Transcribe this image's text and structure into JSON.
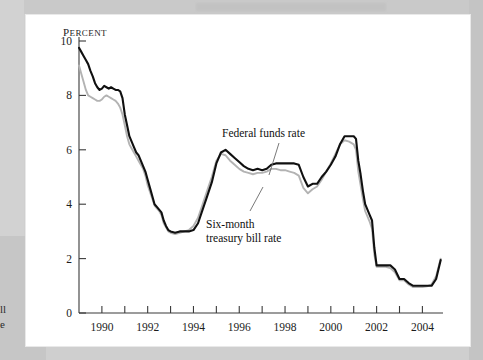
{
  "figure": {
    "y_axis_unit_label": "Percent",
    "y_axis_unit_first_letter": "P",
    "y_axis_unit_rest": "ERCENT"
  },
  "annotations": {
    "federal_funds": "Federal funds rate",
    "six_month_line1": "Six-month",
    "six_month_line2": "treasury bill rate"
  },
  "edge_fragments": {
    "frag1": "ll",
    "frag2": "e"
  },
  "colors": {
    "federal_funds": "#101010",
    "six_month": "#b3b3b3",
    "axis": "#444444",
    "page": "#ffffff",
    "scan_background": "#cfcfcf"
  },
  "chart_data": {
    "type": "line",
    "title": "",
    "xlabel": "",
    "ylabel": "Percent",
    "xlim": [
      1989.0,
      2004.9
    ],
    "ylim": [
      0,
      10
    ],
    "yticks": [
      0,
      2,
      4,
      6,
      8,
      10
    ],
    "ytick_labels": [
      "0",
      "2",
      "4",
      "6",
      "8",
      "10"
    ],
    "xticks": [
      1990,
      1991,
      1992,
      1993,
      1994,
      1995,
      1996,
      1997,
      1998,
      1999,
      2000,
      2001,
      2002,
      2003,
      2004
    ],
    "xtick_labels": [
      "1990",
      "",
      "1992",
      "",
      "1994",
      "",
      "1996",
      "",
      "1998",
      "",
      "2000",
      "",
      "2002",
      "",
      "2004"
    ],
    "labeled_xticks": [
      1990,
      1992,
      1994,
      1996,
      1998,
      2000,
      2002,
      2004
    ],
    "grid": false,
    "legend": "annotated-inline",
    "series": [
      {
        "name": "Federal funds rate",
        "color": "#101010",
        "x": [
          1989.0,
          1989.1,
          1989.2,
          1989.3,
          1989.4,
          1989.5,
          1989.6,
          1989.7,
          1989.8,
          1989.9,
          1990.0,
          1990.1,
          1990.2,
          1990.3,
          1990.4,
          1990.5,
          1990.6,
          1990.7,
          1990.8,
          1990.9,
          1991.0,
          1991.1,
          1991.2,
          1991.3,
          1991.4,
          1991.5,
          1991.6,
          1991.7,
          1991.8,
          1991.9,
          1992.0,
          1992.1,
          1992.2,
          1992.3,
          1992.4,
          1992.5,
          1992.6,
          1992.7,
          1992.8,
          1992.9,
          1993.0,
          1993.2,
          1993.4,
          1993.6,
          1993.8,
          1994.0,
          1994.2,
          1994.4,
          1994.6,
          1994.8,
          1995.0,
          1995.2,
          1995.4,
          1995.6,
          1995.8,
          1996.0,
          1996.2,
          1996.4,
          1996.6,
          1996.8,
          1997.0,
          1997.2,
          1997.4,
          1997.6,
          1997.8,
          1998.0,
          1998.2,
          1998.4,
          1998.6,
          1998.8,
          1999.0,
          1999.2,
          1999.4,
          1999.6,
          1999.8,
          2000.0,
          2000.2,
          2000.4,
          2000.6,
          2000.8,
          2001.0,
          2001.1,
          2001.2,
          2001.3,
          2001.4,
          2001.5,
          2001.6,
          2001.7,
          2001.8,
          2001.9,
          2002.0,
          2002.2,
          2002.4,
          2002.6,
          2002.8,
          2003.0,
          2003.2,
          2003.4,
          2003.6,
          2003.8,
          2004.0,
          2004.2,
          2004.4,
          2004.6,
          2004.8
        ],
        "y": [
          9.75,
          9.6,
          9.45,
          9.3,
          9.15,
          8.9,
          8.7,
          8.45,
          8.3,
          8.2,
          8.25,
          8.35,
          8.3,
          8.25,
          8.3,
          8.25,
          8.2,
          8.2,
          8.15,
          7.9,
          7.3,
          6.9,
          6.5,
          6.3,
          6.1,
          5.9,
          5.8,
          5.6,
          5.4,
          5.2,
          4.9,
          4.6,
          4.3,
          4.0,
          3.9,
          3.8,
          3.7,
          3.4,
          3.2,
          3.05,
          3.0,
          2.95,
          3.0,
          3.0,
          3.0,
          3.05,
          3.3,
          3.8,
          4.3,
          4.8,
          5.5,
          5.9,
          6.0,
          5.85,
          5.7,
          5.55,
          5.4,
          5.3,
          5.25,
          5.3,
          5.25,
          5.3,
          5.45,
          5.5,
          5.5,
          5.5,
          5.5,
          5.5,
          5.45,
          5.0,
          4.65,
          4.75,
          4.75,
          5.0,
          5.2,
          5.45,
          5.75,
          6.2,
          6.5,
          6.5,
          6.5,
          6.4,
          5.6,
          5.1,
          4.5,
          4.0,
          3.8,
          3.6,
          3.4,
          2.4,
          1.75,
          1.75,
          1.75,
          1.75,
          1.6,
          1.25,
          1.25,
          1.1,
          1.0,
          1.0,
          1.0,
          1.0,
          1.0,
          1.25,
          1.95
        ]
      },
      {
        "name": "Six-month treasury bill rate",
        "color": "#b3b3b3",
        "x": [
          1989.0,
          1989.1,
          1989.2,
          1989.3,
          1989.4,
          1989.5,
          1989.6,
          1989.7,
          1989.8,
          1989.9,
          1990.0,
          1990.1,
          1990.2,
          1990.3,
          1990.4,
          1990.5,
          1990.6,
          1990.7,
          1990.8,
          1990.9,
          1991.0,
          1991.1,
          1991.2,
          1991.3,
          1991.4,
          1991.5,
          1991.6,
          1991.7,
          1991.8,
          1991.9,
          1992.0,
          1992.1,
          1992.2,
          1992.3,
          1992.4,
          1992.5,
          1992.6,
          1992.7,
          1992.8,
          1992.9,
          1993.0,
          1993.2,
          1993.4,
          1993.6,
          1993.8,
          1994.0,
          1994.2,
          1994.4,
          1994.6,
          1994.8,
          1995.0,
          1995.2,
          1995.4,
          1995.6,
          1995.8,
          1996.0,
          1996.2,
          1996.4,
          1996.6,
          1996.8,
          1997.0,
          1997.2,
          1997.4,
          1997.6,
          1997.8,
          1998.0,
          1998.2,
          1998.4,
          1998.6,
          1998.8,
          1999.0,
          1999.2,
          1999.4,
          1999.6,
          1999.8,
          2000.0,
          2000.2,
          2000.4,
          2000.6,
          2000.8,
          2001.0,
          2001.1,
          2001.2,
          2001.3,
          2001.4,
          2001.5,
          2001.6,
          2001.7,
          2001.8,
          2001.9,
          2002.0,
          2002.2,
          2002.4,
          2002.6,
          2002.8,
          2003.0,
          2003.2,
          2003.4,
          2003.6,
          2003.8,
          2004.0,
          2004.2,
          2004.4,
          2004.6,
          2004.8
        ],
        "y": [
          9.1,
          8.8,
          8.5,
          8.2,
          8.0,
          7.95,
          7.9,
          7.85,
          7.8,
          7.8,
          7.85,
          7.95,
          8.0,
          7.95,
          7.9,
          7.85,
          7.8,
          7.7,
          7.55,
          7.3,
          6.9,
          6.5,
          6.2,
          6.05,
          5.9,
          5.75,
          5.6,
          5.45,
          5.3,
          5.05,
          4.7,
          4.45,
          4.2,
          3.95,
          3.85,
          3.75,
          3.6,
          3.3,
          3.15,
          3.0,
          2.95,
          2.9,
          2.95,
          3.0,
          3.05,
          3.2,
          3.5,
          4.0,
          4.5,
          5.0,
          5.6,
          5.85,
          5.8,
          5.6,
          5.45,
          5.3,
          5.2,
          5.15,
          5.1,
          5.15,
          5.15,
          5.2,
          5.3,
          5.3,
          5.25,
          5.25,
          5.2,
          5.15,
          5.05,
          4.6,
          4.4,
          4.55,
          4.65,
          4.9,
          5.2,
          5.5,
          5.85,
          6.2,
          6.35,
          6.3,
          6.2,
          6.0,
          5.2,
          4.7,
          4.2,
          3.75,
          3.55,
          3.35,
          3.1,
          2.15,
          1.7,
          1.7,
          1.7,
          1.65,
          1.5,
          1.2,
          1.2,
          1.05,
          0.95,
          0.95,
          0.95,
          0.98,
          1.05,
          1.35,
          2.0
        ]
      }
    ]
  }
}
